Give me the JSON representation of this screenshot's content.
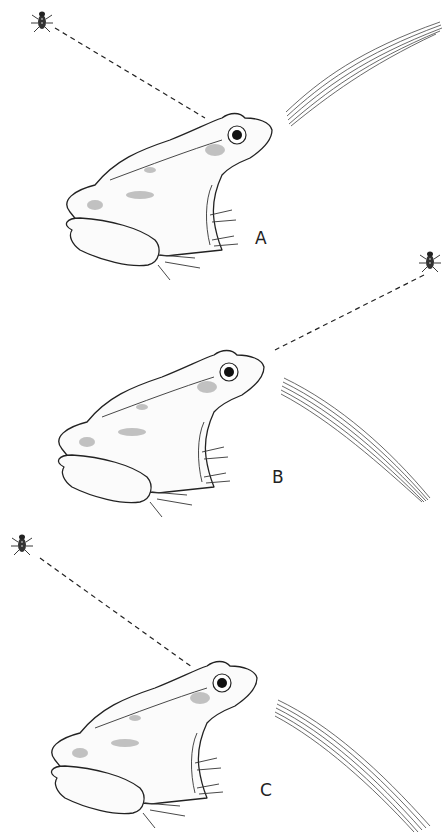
{
  "figure": {
    "type": "scientific illustration",
    "panels": [
      {
        "label": "A",
        "insect_position": "upper-left",
        "grass_position": "upper-right, rising to right"
      },
      {
        "label": "B",
        "insect_position": "upper-right",
        "grass_position": "lower-right, descending to right"
      },
      {
        "label": "C",
        "insect_position": "upper-left",
        "grass_position": "lower-right, descending to right"
      }
    ]
  },
  "colors": {
    "ink": "#222222",
    "background": "#ffffff"
  }
}
